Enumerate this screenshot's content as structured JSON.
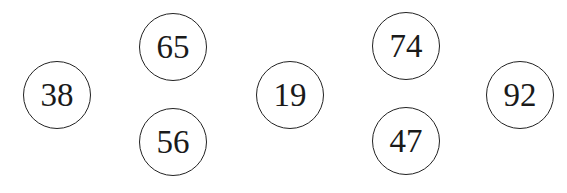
{
  "nodes": [
    {
      "label": "38",
      "cx": 57,
      "cy": 95
    },
    {
      "label": "65",
      "cx": 173,
      "cy": 47
    },
    {
      "label": "56",
      "cx": 173,
      "cy": 142
    },
    {
      "label": "19",
      "cx": 290,
      "cy": 95
    },
    {
      "label": "74",
      "cx": 406,
      "cy": 46
    },
    {
      "label": "47",
      "cx": 406,
      "cy": 141
    },
    {
      "label": "92",
      "cx": 520,
      "cy": 95
    }
  ]
}
